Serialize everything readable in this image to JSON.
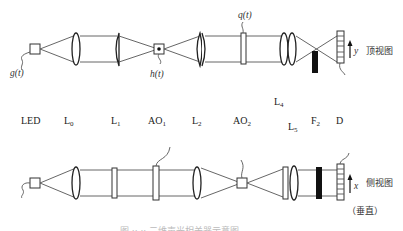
{
  "top_view": {
    "label": "顶视图",
    "axis": "y",
    "signals": {
      "g": "g(t)",
      "h": "h(t)",
      "q": "q(t)"
    }
  },
  "side_view": {
    "label": "侧视图",
    "orientation_note": "（垂直）",
    "axis": "x"
  },
  "components": [
    {
      "id": "LED",
      "base": "LED",
      "sub": ""
    },
    {
      "id": "L0",
      "base": "L",
      "sub": "0"
    },
    {
      "id": "L1",
      "base": "L",
      "sub": "1"
    },
    {
      "id": "AO1",
      "base": "AO",
      "sub": "1"
    },
    {
      "id": "L2",
      "base": "L",
      "sub": "2"
    },
    {
      "id": "AO2",
      "base": "AO",
      "sub": "2"
    },
    {
      "id": "L4",
      "base": "L",
      "sub": "4"
    },
    {
      "id": "L5",
      "base": "L",
      "sub": "5"
    },
    {
      "id": "F2",
      "base": "F",
      "sub": "2"
    },
    {
      "id": "D",
      "base": "D",
      "sub": ""
    }
  ],
  "caption": "图 ·· ·· 二维声光相关器示意图"
}
